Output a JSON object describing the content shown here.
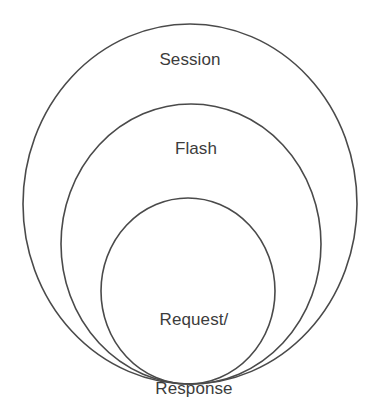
{
  "diagram": {
    "type": "nested-circles",
    "title_visible": false,
    "background_color": "#ffffff",
    "stroke_color": "#4a4a4a",
    "text_color": "#3c3c3c",
    "scopes": [
      {
        "id": "session",
        "label": "Session",
        "level": 1,
        "description": "outermost scope",
        "geometry": {
          "cx": 190,
          "cy": 204,
          "rx": 167,
          "ry": 180
        }
      },
      {
        "id": "flash",
        "label": "Flash",
        "level": 2,
        "description": "middle scope",
        "geometry": {
          "cx": 191,
          "cy": 244,
          "rx": 130,
          "ry": 140
        }
      },
      {
        "id": "request-response",
        "label_line_1": "Request/",
        "label_line_2": "Response",
        "label": "Request/\nResponse",
        "level": 3,
        "description": "innermost scope",
        "geometry": {
          "cx": 188,
          "cy": 291,
          "rx": 87,
          "ry": 93
        }
      }
    ]
  }
}
